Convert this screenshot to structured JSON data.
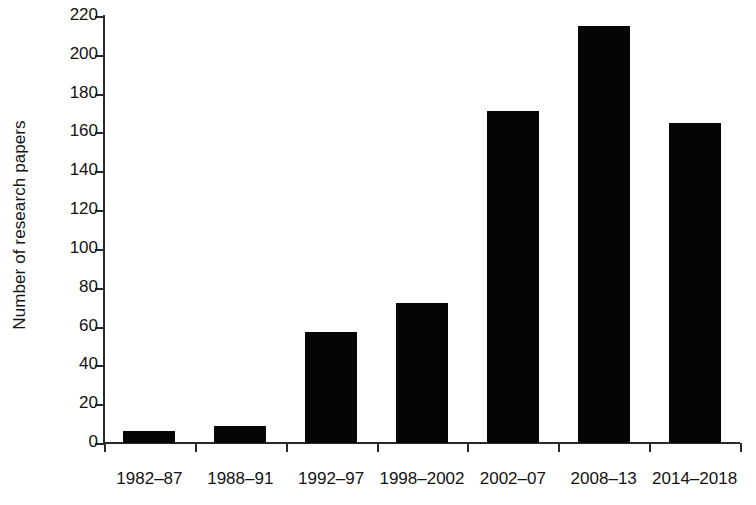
{
  "chart_data": {
    "type": "bar",
    "title": "",
    "xlabel": "",
    "ylabel": "Number of research papers",
    "categories": [
      "1982–87",
      "1988–91",
      "1992–97",
      "1998–2002",
      "2002–07",
      "2008–13",
      "2014–2018"
    ],
    "values": [
      6,
      9,
      57,
      72,
      171,
      215,
      165
    ],
    "ylim": [
      0,
      220
    ],
    "ytick_step": 20,
    "yticks": [
      0,
      20,
      40,
      60,
      80,
      100,
      120,
      140,
      160,
      180,
      200,
      220
    ],
    "ytick_labels": [
      "0",
      "20",
      "40",
      "60",
      "80",
      "100",
      "120",
      "140",
      "160",
      "180",
      "200",
      "220"
    ],
    "grid": false,
    "legend": false,
    "legend_position": "none",
    "series": [
      {
        "name": "Number of research papers",
        "values": [
          6,
          9,
          57,
          72,
          171,
          215,
          165
        ],
        "color": "#050505"
      }
    ],
    "bar_color": "#050505",
    "axis_color": "#2a2a2a",
    "background": "#ffffff"
  }
}
